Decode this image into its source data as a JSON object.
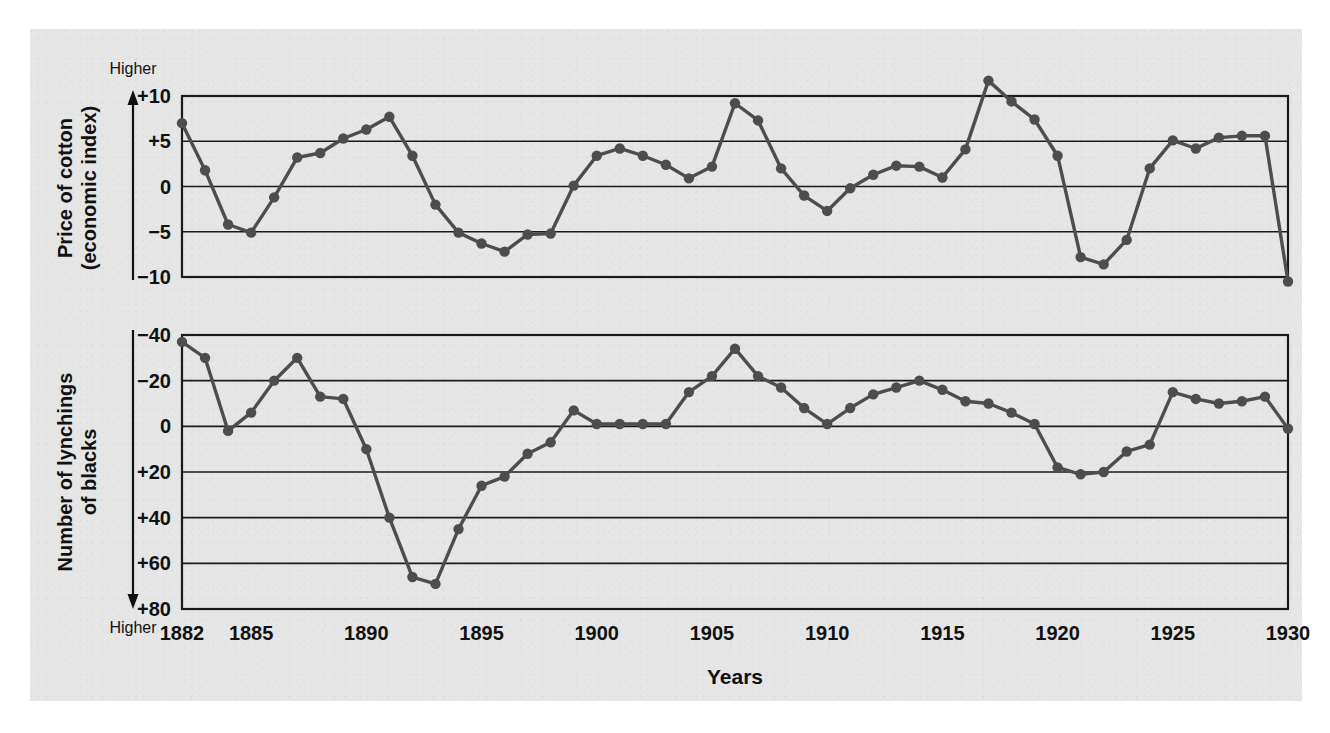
{
  "figure": {
    "background_color": "#e6e6e6",
    "page_color": "#ffffff",
    "series_color": "#4d4d4d",
    "axis_color": "#1a1a1a"
  },
  "xaxis": {
    "title": "Years",
    "tick_labels": [
      "1882",
      "1885",
      "1890",
      "1895",
      "1900",
      "1905",
      "1910",
      "1915",
      "1920",
      "1925",
      "1930"
    ],
    "tick_years": [
      1882,
      1885,
      1890,
      1895,
      1900,
      1905,
      1910,
      1915,
      1920,
      1925,
      1930
    ],
    "range": [
      1882,
      1930
    ]
  },
  "top_panel": {
    "ylabel_line1": "Price of cotton",
    "ylabel_line2": "(economic index)",
    "direction_label": "Higher",
    "direction": "up",
    "tick_labels": [
      "+10",
      "+5",
      "0",
      "−5",
      "−10"
    ],
    "tick_values": [
      10,
      5,
      0,
      -5,
      -10
    ],
    "ylim": [
      -12,
      12
    ]
  },
  "bottom_panel": {
    "ylabel_line1": "Number of lynchings",
    "ylabel_line2": "of blacks",
    "direction_label": "Higher",
    "direction": "down",
    "tick_labels": [
      "−40",
      "−20",
      "0",
      "+20",
      "+40",
      "+60",
      "+80"
    ],
    "tick_values": [
      -40,
      -20,
      0,
      20,
      40,
      60,
      80
    ],
    "ylim": [
      -40,
      80
    ],
    "inverted": true
  },
  "chart_data": [
    {
      "type": "line",
      "title": "Price of cotton (economic index)",
      "xlabel": "Years",
      "ylabel": "Price of cotton (economic index)",
      "ylim": [
        -12,
        12
      ],
      "xlim": [
        1882,
        1930
      ],
      "grid": true,
      "legend": "none",
      "annotations": [
        "Higher"
      ],
      "x": [
        1882,
        1883,
        1884,
        1885,
        1886,
        1887,
        1888,
        1889,
        1890,
        1891,
        1892,
        1893,
        1894,
        1895,
        1896,
        1897,
        1898,
        1899,
        1900,
        1901,
        1902,
        1903,
        1904,
        1905,
        1906,
        1907,
        1908,
        1909,
        1910,
        1911,
        1912,
        1913,
        1914,
        1915,
        1916,
        1917,
        1918,
        1919,
        1920,
        1921,
        1922,
        1923,
        1924,
        1925,
        1926,
        1927,
        1928,
        1929,
        1930
      ],
      "values": [
        7.0,
        1.8,
        -4.2,
        -5.1,
        -1.2,
        3.2,
        3.7,
        5.3,
        6.3,
        7.7,
        3.4,
        -2.0,
        -5.1,
        -6.3,
        -7.2,
        -5.3,
        -5.2,
        0.1,
        3.4,
        4.2,
        3.4,
        2.4,
        0.9,
        2.2,
        9.2,
        7.3,
        2.0,
        -1.0,
        -2.7,
        -0.2,
        1.3,
        2.3,
        2.2,
        1.0,
        4.1,
        11.7,
        9.4,
        7.4,
        3.4,
        -7.8,
        -8.6,
        -5.9,
        2.0,
        5.1,
        4.2,
        5.4,
        5.6,
        5.6,
        -10.5
      ]
    },
    {
      "type": "line",
      "title": "Number of lynchings of blacks",
      "xlabel": "Years",
      "ylabel": "Number of lynchings of blacks",
      "ylim": [
        -40,
        80
      ],
      "xlim": [
        1882,
        1930
      ],
      "grid": true,
      "legend": "none",
      "inverted_yaxis": true,
      "annotations": [
        "Higher"
      ],
      "x": [
        1882,
        1883,
        1884,
        1885,
        1886,
        1887,
        1888,
        1889,
        1890,
        1891,
        1892,
        1893,
        1894,
        1895,
        1896,
        1897,
        1898,
        1899,
        1900,
        1901,
        1902,
        1903,
        1904,
        1905,
        1906,
        1907,
        1908,
        1909,
        1910,
        1911,
        1912,
        1913,
        1914,
        1915,
        1916,
        1917,
        1918,
        1919,
        1920,
        1921,
        1922,
        1923,
        1924,
        1925,
        1926,
        1927,
        1928,
        1929,
        1930
      ],
      "values": [
        -37.0,
        -30.0,
        2.0,
        -6.0,
        -20.0,
        -30.0,
        -13.0,
        -12.0,
        10.0,
        40.0,
        66.0,
        69.0,
        45.0,
        26.0,
        22.0,
        12.0,
        7.0,
        -7.0,
        -1.0,
        -1.0,
        -1.0,
        -1.0,
        -15.0,
        -22.0,
        -34.0,
        -22.0,
        -17.0,
        -8.0,
        -1.0,
        -8.0,
        -14.0,
        -17.0,
        -20.0,
        -16.0,
        -11.0,
        -10.0,
        -6.0,
        -1.0,
        18.0,
        21.0,
        20.0,
        11.0,
        8.0,
        -15.0,
        -12.0,
        -10.0,
        -11.0,
        -13.0,
        1.0
      ]
    }
  ]
}
